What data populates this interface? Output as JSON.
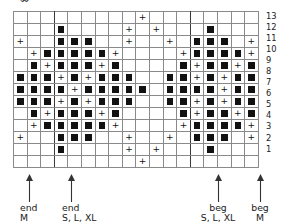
{
  "document": {
    "type": "knitting-stitch-chart",
    "top_partial_glyph": "∞",
    "grid": {
      "columns": 18,
      "rows": 13,
      "row_numbers": [
        13,
        12,
        11,
        10,
        9,
        8,
        7,
        6,
        5,
        4,
        3,
        2,
        1
      ],
      "section_dividers_after_columns": [
        3,
        13
      ],
      "symbols": {
        "filled": "■",
        "plus": "+",
        "empty": ""
      },
      "legend_names": {
        "filled": "filled-square-stitch",
        "plus": "plus-stitch",
        "empty": "blank-stitch"
      },
      "colors": {
        "symbol": "#111111",
        "cell_border": "#8a8a8a",
        "section_border": "#3a3a3a",
        "background": "#ffffff"
      }
    }
  },
  "chart_data": {
    "type": "heatmap",
    "title": "",
    "xlabel": "",
    "ylabel": "",
    "columns": 18,
    "rows": 13,
    "row_labels": [
      13,
      12,
      11,
      10,
      9,
      8,
      7,
      6,
      5,
      4,
      3,
      2,
      1
    ],
    "cell_codes": {
      "0": "empty",
      "1": "filled-square",
      "2": "plus"
    },
    "rows_top_to_bottom": [
      {
        "row": 13,
        "cells": [
          0,
          0,
          0,
          0,
          0,
          0,
          0,
          0,
          0,
          2,
          0,
          0,
          0,
          0,
          0,
          0,
          0,
          0
        ]
      },
      {
        "row": 12,
        "cells": [
          0,
          0,
          0,
          1,
          0,
          0,
          0,
          0,
          2,
          0,
          2,
          0,
          0,
          0,
          1,
          0,
          0,
          0
        ]
      },
      {
        "row": 11,
        "cells": [
          2,
          0,
          0,
          1,
          1,
          1,
          0,
          0,
          2,
          0,
          0,
          2,
          0,
          1,
          1,
          1,
          0,
          2
        ]
      },
      {
        "row": 10,
        "cells": [
          0,
          2,
          1,
          1,
          1,
          1,
          1,
          2,
          0,
          0,
          0,
          0,
          2,
          1,
          1,
          1,
          1,
          2
        ]
      },
      {
        "row": 9,
        "cells": [
          0,
          1,
          2,
          1,
          1,
          1,
          2,
          1,
          0,
          0,
          0,
          0,
          1,
          2,
          1,
          1,
          2,
          1
        ]
      },
      {
        "row": 8,
        "cells": [
          1,
          1,
          1,
          2,
          1,
          2,
          1,
          1,
          1,
          0,
          0,
          1,
          1,
          2,
          1,
          2,
          1,
          1
        ]
      },
      {
        "row": 7,
        "cells": [
          1,
          1,
          1,
          1,
          2,
          1,
          1,
          1,
          1,
          1,
          0,
          1,
          1,
          1,
          1,
          2,
          1,
          1
        ]
      },
      {
        "row": 6,
        "cells": [
          1,
          1,
          1,
          2,
          1,
          2,
          1,
          1,
          1,
          0,
          0,
          1,
          1,
          2,
          1,
          2,
          1,
          1
        ]
      },
      {
        "row": 5,
        "cells": [
          0,
          1,
          2,
          1,
          1,
          1,
          2,
          1,
          0,
          0,
          0,
          0,
          1,
          2,
          1,
          1,
          2,
          1
        ]
      },
      {
        "row": 4,
        "cells": [
          0,
          2,
          1,
          1,
          1,
          1,
          1,
          2,
          0,
          0,
          0,
          0,
          2,
          1,
          1,
          1,
          1,
          2
        ]
      },
      {
        "row": 3,
        "cells": [
          2,
          0,
          0,
          1,
          1,
          1,
          0,
          0,
          2,
          0,
          0,
          2,
          0,
          1,
          1,
          1,
          0,
          2
        ]
      },
      {
        "row": 2,
        "cells": [
          0,
          0,
          0,
          1,
          0,
          0,
          0,
          0,
          2,
          0,
          2,
          0,
          0,
          0,
          1,
          0,
          0,
          0
        ]
      },
      {
        "row": 1,
        "cells": [
          0,
          0,
          0,
          0,
          0,
          0,
          0,
          0,
          0,
          2,
          0,
          0,
          0,
          0,
          0,
          0,
          0,
          0
        ]
      }
    ],
    "legend": [
      {
        "symbol": "■",
        "name": "filled-square"
      },
      {
        "symbol": "+",
        "name": "plus"
      }
    ],
    "grid": true,
    "legend_position": "none"
  },
  "markers": [
    {
      "id": "end-m",
      "line1": "end",
      "line2": "M",
      "arrow_x": 29,
      "text_x": 20,
      "align": "left"
    },
    {
      "id": "end-slxl",
      "line1": "end",
      "line2": "S, L, XL",
      "arrow_x": 71,
      "text_x": 62,
      "align": "left"
    },
    {
      "id": "beg-slxl",
      "line1": "beg",
      "line2": "S, L, XL",
      "arrow_x": 218,
      "text_x": 218,
      "align": "center"
    },
    {
      "id": "beg-m",
      "line1": "beg",
      "line2": "M",
      "arrow_x": 260,
      "text_x": 260,
      "align": "center"
    }
  ]
}
